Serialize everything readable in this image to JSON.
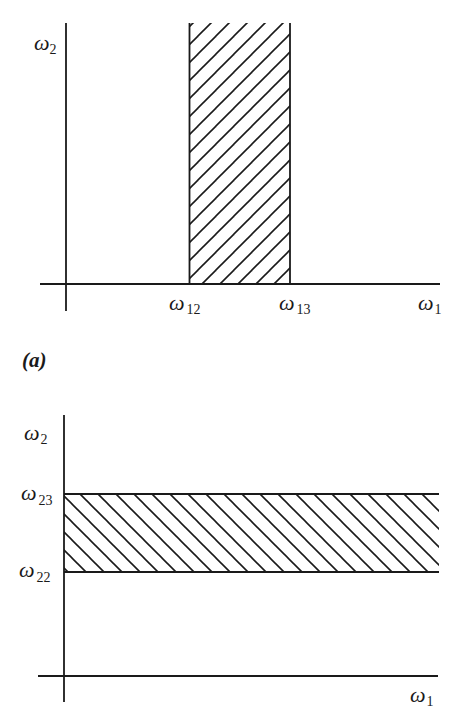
{
  "figure": {
    "panel_a": {
      "caption": "(a)",
      "y_axis_label": {
        "symbol": "ω",
        "subscript": "2"
      },
      "x_axis_label": {
        "symbol": "ω",
        "subscript": "1"
      },
      "band": {
        "orientation": "vertical",
        "hatch": "forward-diagonal",
        "lower_label": {
          "symbol": "ω",
          "subscript": "12"
        },
        "upper_label": {
          "symbol": "ω",
          "subscript": "13"
        }
      }
    },
    "panel_b": {
      "y_axis_label": {
        "symbol": "ω",
        "subscript": "2"
      },
      "x_axis_label": {
        "symbol": "ω",
        "subscript": "1"
      },
      "band": {
        "orientation": "horizontal",
        "hatch": "back-diagonal",
        "upper_label": {
          "symbol": "ω",
          "subscript": "23"
        },
        "lower_label": {
          "symbol": "ω",
          "subscript": "22"
        }
      }
    },
    "colors": {
      "ink": "#1a1a1a",
      "background": "#ffffff"
    }
  }
}
